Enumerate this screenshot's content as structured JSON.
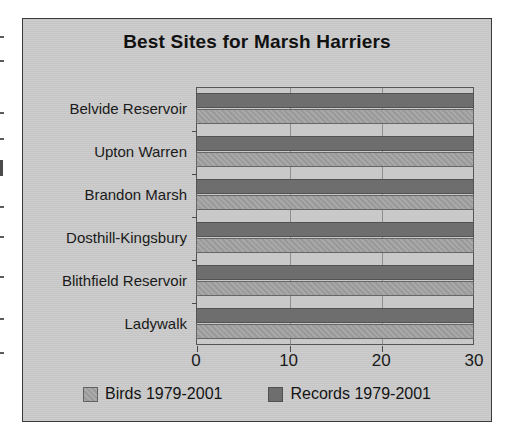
{
  "chart_data": {
    "type": "bar",
    "orientation": "horizontal",
    "title": "Best Sites for Marsh Harriers",
    "xlabel": "",
    "ylabel": "",
    "xlim": [
      0,
      30
    ],
    "xticks": [
      0,
      10,
      20,
      30
    ],
    "xtick_labels": [
      "0",
      "10",
      "20",
      "30"
    ],
    "grid": true,
    "legend_position": "bottom",
    "categories": [
      "Belvide Reservoir",
      "Upton Warren",
      "Brandon Marsh",
      "Dosthill-Kingsbury",
      "Blithfield Reservoir",
      "Ladywalk"
    ],
    "series": [
      {
        "name": "Records 1979-2001",
        "color": "#6e6e6e",
        "values": [
          26,
          26,
          20,
          20,
          14,
          11
        ]
      },
      {
        "name": "Birds 1979-2001",
        "color": "#9a9a9a",
        "values": [
          26,
          26,
          21,
          20,
          14,
          11
        ]
      }
    ]
  },
  "legend": {
    "items": [
      {
        "label": "Birds 1979-2001",
        "swatch": "birds-swatch"
      },
      {
        "label": "Records 1979-2001",
        "swatch": "records-swatch"
      }
    ]
  },
  "colors": {
    "background": "#cbcbcb",
    "plot_background": "#c9c9c9",
    "records_bar": "#6e6e6e",
    "birds_bar": "#9a9a9a",
    "axis": "#555555",
    "text": "#1a1a1a"
  }
}
